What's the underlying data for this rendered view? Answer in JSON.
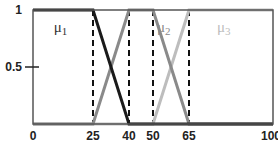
{
  "chart_data": {
    "type": "line",
    "title": "",
    "xlabel": "",
    "ylabel": "",
    "xlim": [
      0,
      100
    ],
    "ylim": [
      0,
      1
    ],
    "grid": false,
    "x_ticks": [
      0,
      25,
      40,
      50,
      65,
      100
    ],
    "x_tick_labels": [
      "0",
      "25",
      "40",
      "50",
      "65",
      "100"
    ],
    "y_ticks": [
      0.5,
      1
    ],
    "y_tick_labels": [
      "0.5",
      "1"
    ],
    "dashed_verticals": [
      25,
      40,
      50,
      65
    ],
    "series": [
      {
        "name": "μ1",
        "label": "μ",
        "subscript": "1",
        "color": "#1a1a1a",
        "label_x": 12,
        "points": [
          [
            0,
            1
          ],
          [
            25,
            1
          ],
          [
            40,
            0
          ],
          [
            100,
            0
          ]
        ]
      },
      {
        "name": "μ2",
        "label": "μ",
        "subscript": "2",
        "color": "#8a8a8a",
        "label_x": 55,
        "points": [
          [
            0,
            0
          ],
          [
            25,
            0
          ],
          [
            40,
            1
          ],
          [
            50,
            1
          ],
          [
            65,
            0
          ],
          [
            100,
            0
          ]
        ]
      },
      {
        "name": "μ3",
        "label": "μ",
        "subscript": "3",
        "color": "#bdbdbd",
        "label_x": 80,
        "points": [
          [
            0,
            0
          ],
          [
            50,
            0
          ],
          [
            65,
            1
          ],
          [
            100,
            1
          ]
        ]
      }
    ]
  }
}
